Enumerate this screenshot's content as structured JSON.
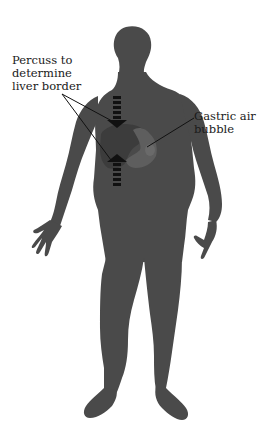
{
  "figure": {
    "colors": {
      "background": "#ffffff",
      "body_silhouette": "#4a4a4a",
      "liver": "#3e3e3e",
      "stomach": "#5a5a5a",
      "arrow": "#111111",
      "leader_line": "#111111",
      "text": "#1a1a1a"
    },
    "labels": {
      "liver": {
        "lines": [
          "Percuss to",
          "determine",
          "liver border"
        ]
      },
      "gastric": {
        "lines": [
          "Gastric air",
          "bubble"
        ]
      }
    },
    "arrows": [
      {
        "name": "upper-percussion-arrow",
        "direction": "down"
      },
      {
        "name": "lower-percussion-arrow",
        "direction": "up"
      }
    ],
    "icons": {
      "body": "human-silhouette-icon",
      "liver": "liver-icon",
      "stomach": "stomach-icon"
    }
  }
}
